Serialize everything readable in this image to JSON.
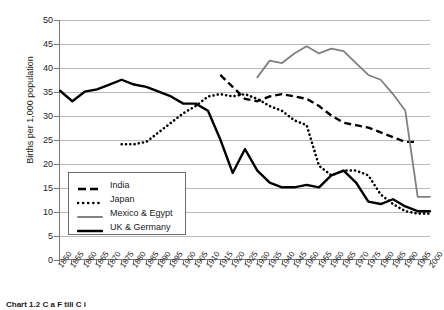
{
  "chart_data": {
    "type": "line",
    "title": "",
    "xlabel": "",
    "ylabel": "Births per 1,000 population",
    "xlim": [
      1850,
      2000
    ],
    "ylim": [
      0,
      50
    ],
    "ytick_step": 5,
    "xtick_step": 5,
    "grid": "horizontal",
    "legend_position": "inside-lower-left",
    "yticks": [
      0,
      5,
      10,
      15,
      20,
      25,
      30,
      35,
      40,
      45,
      50
    ],
    "xticks": [
      1850,
      1855,
      1860,
      1865,
      1870,
      1875,
      1880,
      1885,
      1890,
      1895,
      1900,
      1905,
      1910,
      1915,
      1920,
      1925,
      1930,
      1935,
      1940,
      1945,
      1950,
      1955,
      1960,
      1965,
      1970,
      1975,
      1980,
      1985,
      1990,
      1995,
      2000
    ],
    "series": [
      {
        "name": "India",
        "style": "dashed",
        "color": "#000000",
        "x": [
          1915,
          1920,
          1925,
          1930,
          1935,
          1940,
          1945,
          1950,
          1955,
          1960,
          1965,
          1970,
          1975,
          1980,
          1985,
          1990,
          1995
        ],
        "values": [
          38.5,
          36.0,
          33.5,
          33.0,
          34.0,
          34.5,
          34.0,
          33.5,
          32.0,
          30.0,
          28.5,
          28.0,
          27.5,
          26.5,
          25.5,
          24.5,
          24.5
        ]
      },
      {
        "name": "Japan",
        "style": "dotted",
        "color": "#000000",
        "x": [
          1875,
          1880,
          1885,
          1890,
          1895,
          1900,
          1905,
          1910,
          1915,
          1920,
          1925,
          1930,
          1935,
          1940,
          1945,
          1950,
          1955,
          1960,
          1965,
          1970,
          1975,
          1980,
          1985,
          1990,
          1995,
          2000
        ],
        "values": [
          24.0,
          24.0,
          24.5,
          26.5,
          28.5,
          30.5,
          32.0,
          34.0,
          34.5,
          34.0,
          34.5,
          33.5,
          32.0,
          31.0,
          29.0,
          28.0,
          19.5,
          17.5,
          18.5,
          18.5,
          17.5,
          13.5,
          11.5,
          10.0,
          9.5,
          9.5
        ]
      },
      {
        "name": "Mexico & Egypt",
        "style": "solid",
        "color": "#808080",
        "x": [
          1930,
          1935,
          1940,
          1945,
          1950,
          1955,
          1960,
          1965,
          1970,
          1975,
          1980,
          1985,
          1990,
          1995,
          2000
        ],
        "values": [
          38.0,
          41.5,
          41.0,
          43.0,
          44.5,
          43.0,
          44.0,
          43.5,
          41.0,
          38.5,
          37.5,
          34.5,
          31.0,
          13.0,
          13.0
        ]
      },
      {
        "name": "UK & Germany",
        "style": "solid-bold",
        "color": "#000000",
        "x": [
          1850,
          1855,
          1860,
          1865,
          1870,
          1875,
          1880,
          1885,
          1890,
          1895,
          1900,
          1905,
          1910,
          1915,
          1920,
          1925,
          1930,
          1935,
          1940,
          1945,
          1950,
          1955,
          1960,
          1965,
          1970,
          1975,
          1980,
          1985,
          1990,
          1995,
          2000
        ],
        "values": [
          35.2,
          33.0,
          35.0,
          35.5,
          36.5,
          37.5,
          36.5,
          36.0,
          35.0,
          34.0,
          32.5,
          32.5,
          31.0,
          25.0,
          18.0,
          23.0,
          18.5,
          16.0,
          15.0,
          15.0,
          15.5,
          15.0,
          17.5,
          18.5,
          16.0,
          12.0,
          11.5,
          12.5,
          11.0,
          10.0,
          10.0
        ]
      }
    ]
  },
  "legend": {
    "items": [
      {
        "label": "India",
        "style": "dashed",
        "color": "#000000"
      },
      {
        "label": "Japan",
        "style": "dotted",
        "color": "#000000"
      },
      {
        "label": "Mexico & Egypt",
        "style": "solid",
        "color": "#808080"
      },
      {
        "label": "UK & Germany",
        "style": "solid-bold",
        "color": "#000000"
      }
    ]
  },
  "caption": {
    "text": "Chart 1.2 C               a  F  tili   C          i    "
  }
}
